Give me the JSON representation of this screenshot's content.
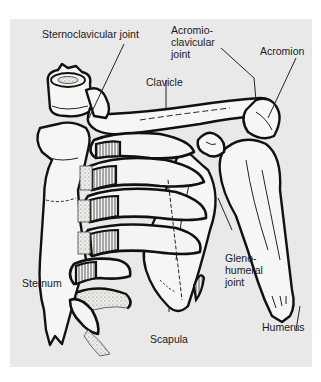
{
  "figure": {
    "background_color": "#e9e9e9",
    "line_color": "#111111",
    "labels": {
      "sternoclavicular_joint": "Sternoclavicular joint",
      "acromioclavicular_joint_line1": "Acromio-",
      "acromioclavicular_joint_line2": "clavicular",
      "acromioclavicular_joint_line3": "joint",
      "acromion": "Acromion",
      "clavicle": "Clavicle",
      "glenohumeral_joint_line1": "Gleno-",
      "glenohumeral_joint_line2": "humeral",
      "glenohumeral_joint_line3": "joint",
      "sternum": "Sternum",
      "scapula": "Scapula",
      "humerus": "Humerus"
    }
  }
}
